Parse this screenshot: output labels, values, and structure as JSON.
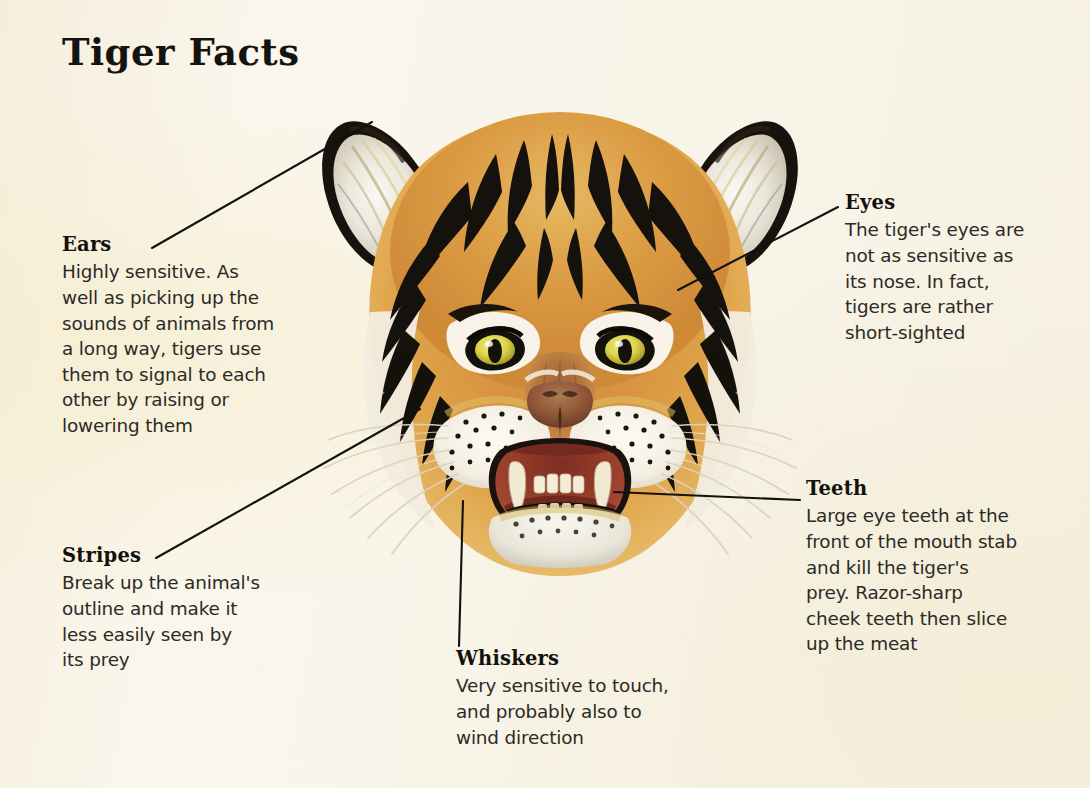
{
  "page": {
    "title": "Tiger Facts",
    "background_color": "#f7f3e6",
    "ink_color": "#151310"
  },
  "illustration": {
    "name": "tiger-head-illustration",
    "subject": "Tiger head, front view, mouth open",
    "colors": {
      "fur_orange": "#d9893a",
      "fur_light": "#edc169",
      "stripe_black": "#14100c",
      "fur_white": "#f6f2e8",
      "eye_yellow": "#e5e04a",
      "nose_brown": "#8e5a38",
      "mouth_red": "#9d3d2c",
      "tooth_cream": "#efe6cf"
    }
  },
  "callouts": [
    {
      "id": "ears",
      "heading": "Ears",
      "body": "Highly sensitive. As\nwell as picking up the\nsounds of animals from\na long way, tigers use\nthem to signal to each\nother by raising or\nlowering them"
    },
    {
      "id": "eyes",
      "heading": "Eyes",
      "body": "The tiger's eyes are\nnot as sensitive as\nits nose. In fact,\ntigers are rather\nshort-sighted"
    },
    {
      "id": "stripes",
      "heading": "Stripes",
      "body": "Break up the animal's\noutline and make it\nless easily seen by\nits prey"
    },
    {
      "id": "teeth",
      "heading": "Teeth",
      "body": "Large eye teeth at the\nfront of the mouth stab\nand kill the tiger's\nprey. Razor-sharp\ncheek teeth then slice\nup the meat"
    },
    {
      "id": "whiskers",
      "heading": "Whiskers",
      "body": "Very sensitive to touch,\nand probably also to\nwind direction"
    }
  ],
  "leader_lines": [
    {
      "id": "ears",
      "from": [
        152,
        248
      ],
      "to": [
        372,
        122
      ]
    },
    {
      "id": "eyes",
      "from": [
        838,
        207
      ],
      "to": [
        678,
        290
      ]
    },
    {
      "id": "stripes",
      "from": [
        156,
        558
      ],
      "to": [
        420,
        409
      ]
    },
    {
      "id": "teeth",
      "from": [
        800,
        500
      ],
      "to": [
        614,
        492
      ]
    },
    {
      "id": "whiskers",
      "from": [
        459,
        646
      ],
      "to": [
        463,
        501
      ]
    }
  ]
}
